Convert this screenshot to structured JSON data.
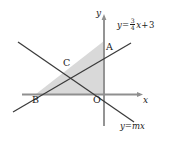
{
  "figure": {
    "type": "geometry-diagram",
    "background_color": "#ffffff",
    "stroke_color": "#3a3a3a",
    "axis_color": "#8a8a8a",
    "shade_color": "#d9d9d9",
    "axes": {
      "x_label": "x",
      "y_label": "y"
    },
    "points": [
      {
        "name": "A",
        "label": "A"
      },
      {
        "name": "B",
        "label": "B"
      },
      {
        "name": "C",
        "label": "C"
      },
      {
        "name": "O",
        "label": "O"
      }
    ],
    "equations": {
      "line1": {
        "lhs": "y",
        "eq": "=",
        "numerator": "3",
        "denominator": "4",
        "variable": "x",
        "plus": "+",
        "constant": "3"
      },
      "line2": {
        "text": "y=mx"
      }
    }
  }
}
